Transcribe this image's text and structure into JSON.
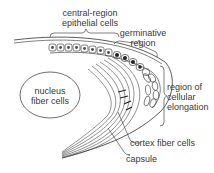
{
  "diagram": {
    "labels": {
      "central_epithelial_line1": "central-region",
      "central_epithelial_line2": "epithelial cells",
      "germinative_line1": "germinative",
      "germinative_line2": "region",
      "nucleus_line1": "nucleus",
      "nucleus_line2": "fiber cells",
      "elongation_line1": "region of",
      "elongation_line2": "cellular",
      "elongation_line3": "elongation",
      "cortex": "cortex fiber cells",
      "capsule": "capsule"
    },
    "colors": {
      "line": "#4a4a4a",
      "text": "#3a3a3a",
      "background": "#ffffff",
      "nucleus_dark": "#222222"
    }
  }
}
